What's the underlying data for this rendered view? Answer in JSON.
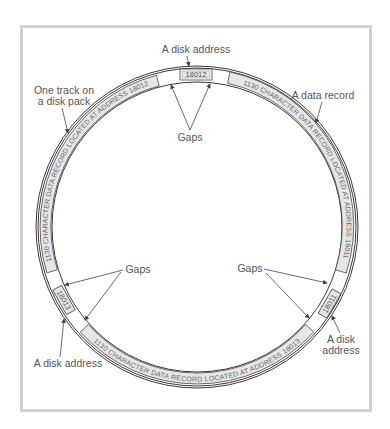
{
  "figure": {
    "colors": {
      "frame": "#d2d2d2",
      "ring_stroke": "#3a3a3a",
      "record_fill": "#e6e6e6",
      "label_text": "#555555",
      "arrow": "#444444"
    },
    "labels": {
      "disk_address_top": "A disk address",
      "one_track_line1": "One track on",
      "one_track_line2": "a disk pack",
      "data_record": "A data record",
      "gaps_top": "Gaps",
      "gaps_left": "Gaps",
      "gaps_right": "Gaps",
      "disk_address_bottom_left": "A disk address",
      "disk_address_right_line1": "A disk",
      "disk_address_right_line2": "address"
    },
    "track": {
      "addresses": [
        {
          "id": "18012",
          "position": "top"
        },
        {
          "id": "18011",
          "position": "right"
        },
        {
          "id": "18013",
          "position": "left"
        }
      ],
      "records": [
        {
          "text": "1130 CHARACTER DATA RECORD LOCATED AT ADDRESS 18011",
          "position": "right"
        },
        {
          "text": "1130 CHARACTER DATA RECORD LOCATED AT ADDRESS 18013",
          "position": "bottom"
        },
        {
          "text": "1130 CHARACTER DATA RECORD LOCATED AT ADDRESS 18012",
          "position": "left"
        }
      ]
    }
  }
}
